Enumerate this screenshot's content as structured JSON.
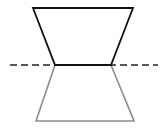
{
  "diagram": {
    "colors": {
      "background": "#ffffff",
      "original": "#111111",
      "reflection": "#8a8a8a",
      "axis": "#222222"
    },
    "original_shape": {
      "label": "original trapezoid",
      "points": [
        [
          33,
          8
        ],
        [
          133,
          8
        ],
        [
          111,
          65
        ],
        [
          55,
          65
        ]
      ]
    },
    "reflected_shape": {
      "label": "reflected trapezoid",
      "points": [
        [
          55,
          65
        ],
        [
          111,
          65
        ],
        [
          134,
          121
        ],
        [
          36,
          121
        ]
      ]
    },
    "axis_line": {
      "label": "line of reflection",
      "x1": 10,
      "y1": 65,
      "x2": 158,
      "y2": 65,
      "dash": "7 4"
    }
  }
}
